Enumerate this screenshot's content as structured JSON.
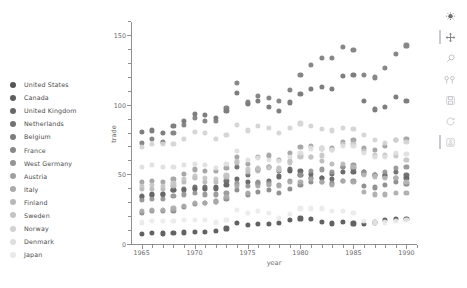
{
  "chart_data": {
    "type": "scatter",
    "title": "",
    "xlabel": "year",
    "ylabel": "trade",
    "xlim": [
      1964,
      1991
    ],
    "ylim": [
      0,
      160
    ],
    "x_ticks": [
      1965,
      1970,
      1975,
      1980,
      1985,
      1990
    ],
    "y_ticks": [
      0,
      50,
      100,
      150
    ],
    "grid": false,
    "legend_position": "left-outside",
    "series": [
      {
        "name": "United States",
        "color": "#555555",
        "x": [
          1965,
          1966,
          1967,
          1968,
          1969,
          1970,
          1971,
          1972,
          1973,
          1974,
          1975,
          1976,
          1977,
          1978,
          1979,
          1980,
          1981,
          1982,
          1983,
          1984,
          1985,
          1986,
          1987,
          1988,
          1989,
          1990
        ],
        "values": [
          9.6,
          10.2,
          10.0,
          10.7,
          10.8,
          11.3,
          11.2,
          11.9,
          13.6,
          17.5,
          16.2,
          16.8,
          17.0,
          17.7,
          19.6,
          20.8,
          20.2,
          18.4,
          17.2,
          18.3,
          17.3,
          17.1,
          18.0,
          19.7,
          20.7,
          20.6
        ]
      },
      {
        "name": "Canada",
        "color": "#5e5e5e",
        "x": [
          1965,
          1966,
          1967,
          1968,
          1969,
          1970,
          1971,
          1972,
          1973,
          1974,
          1975,
          1976,
          1977,
          1978,
          1979,
          1980,
          1981,
          1982,
          1983,
          1984,
          1985,
          1986,
          1987,
          1988,
          1989,
          1990
        ],
        "values": [
          36.0,
          38.0,
          38.5,
          41.0,
          41.5,
          42.0,
          42.0,
          43.0,
          45.0,
          49.0,
          47.0,
          46.0,
          48.0,
          51.0,
          55.0,
          55.0,
          53.0,
          50.0,
          49.0,
          54.0,
          54.0,
          54.0,
          52.0,
          52.0,
          50.0,
          50.0
        ]
      },
      {
        "name": "United Kingdom",
        "color": "#686868",
        "x": [
          1965,
          1966,
          1967,
          1968,
          1969,
          1970,
          1971,
          1972,
          1973,
          1974,
          1975,
          1976,
          1977,
          1978,
          1979,
          1980,
          1981,
          1982,
          1983,
          1984,
          1985,
          1986,
          1987,
          1988,
          1989,
          1990
        ],
        "values": [
          37.0,
          37.5,
          38.0,
          41.0,
          42.0,
          43.0,
          43.0,
          42.0,
          48.0,
          58.0,
          52.0,
          56.0,
          58.0,
          55.0,
          56.0,
          52.0,
          50.0,
          50.0,
          53.0,
          58.0,
          57.0,
          53.0,
          52.0,
          51.0,
          54.0,
          52.0
        ]
      },
      {
        "name": "Netherlands",
        "color": "#737373",
        "x": [
          1965,
          1966,
          1967,
          1968,
          1969,
          1970,
          1971,
          1972,
          1973,
          1974,
          1975,
          1976,
          1977,
          1978,
          1979,
          1980,
          1981,
          1982,
          1983,
          1984,
          1985,
          1986,
          1987,
          1988,
          1989,
          1990
        ],
        "values": [
          83.0,
          84.0,
          82.0,
          87.0,
          91.0,
          96.0,
          95.0,
          93.0,
          98.0,
          111.0,
          103.0,
          105.0,
          101.0,
          98.0,
          104.0,
          110.0,
          114.0,
          115.0,
          114.0,
          123.0,
          124.0,
          105.0,
          99.0,
          101.0,
          108.0,
          105.0
        ]
      },
      {
        "name": "Belgium",
        "color": "#7d7d7d",
        "x": [
          1965,
          1966,
          1967,
          1968,
          1969,
          1970,
          1971,
          1972,
          1973,
          1974,
          1975,
          1976,
          1977,
          1978,
          1979,
          1980,
          1981,
          1982,
          1983,
          1984,
          1985,
          1986,
          1987,
          1988,
          1989,
          1990
        ],
        "values": [
          75.0,
          78.0,
          76.0,
          82.0,
          88.0,
          93.0,
          91.0,
          91.0,
          100.0,
          118.0,
          104.0,
          109.0,
          107.0,
          105.0,
          113.0,
          124.0,
          131.0,
          136.0,
          136.0,
          144.0,
          142.0,
          124.0,
          122.0,
          129.0,
          139.0,
          145.0
        ]
      },
      {
        "name": "France",
        "color": "#888888",
        "x": [
          1965,
          1966,
          1967,
          1968,
          1969,
          1970,
          1971,
          1972,
          1973,
          1974,
          1975,
          1976,
          1977,
          1978,
          1979,
          1980,
          1981,
          1982,
          1983,
          1984,
          1985,
          1986,
          1987,
          1988,
          1989,
          1990
        ],
        "values": [
          25.0,
          26.0,
          26.0,
          26.0,
          29.0,
          31.0,
          32.0,
          33.0,
          35.0,
          41.0,
          38.0,
          40.0,
          41.0,
          39.0,
          42.0,
          45.0,
          47.0,
          47.0,
          46.0,
          48.0,
          48.0,
          44.0,
          43.0,
          45.0,
          47.0,
          46.0
        ]
      },
      {
        "name": "West Germany",
        "color": "#949494",
        "x": [
          1965,
          1966,
          1967,
          1968,
          1969,
          1970,
          1971,
          1972,
          1973,
          1974,
          1975,
          1976,
          1977,
          1978,
          1979,
          1980,
          1981,
          1982,
          1983,
          1984,
          1985,
          1986,
          1987,
          1988,
          1989,
          1990
        ],
        "values": [
          34.0,
          35.0,
          35.0,
          37.0,
          38.0,
          39.0,
          38.0,
          38.0,
          39.0,
          46.0,
          44.0,
          47.0,
          46.0,
          45.0,
          48.0,
          52.0,
          55.0,
          56.0,
          54.0,
          58.0,
          59.0,
          54.0,
          52.0,
          54.0,
          57.0,
          58.0
        ]
      },
      {
        "name": "Austria",
        "color": "#9f9f9f",
        "x": [
          1965,
          1966,
          1967,
          1968,
          1969,
          1970,
          1971,
          1972,
          1973,
          1974,
          1975,
          1976,
          1977,
          1978,
          1979,
          1980,
          1981,
          1982,
          1983,
          1984,
          1985,
          1986,
          1987,
          1988,
          1989,
          1990
        ],
        "values": [
          47.0,
          48.0,
          47.0,
          49.0,
          53.0,
          56.0,
          55.0,
          55.0,
          57.0,
          65.0,
          60.0,
          65.0,
          66.0,
          63.0,
          68.0,
          72.0,
          73.0,
          71.0,
          71.0,
          76.0,
          77.0,
          71.0,
          70.0,
          73.0,
          77.0,
          78.0
        ]
      },
      {
        "name": "Italy",
        "color": "#aaaaaa",
        "x": [
          1965,
          1966,
          1967,
          1968,
          1969,
          1970,
          1971,
          1972,
          1973,
          1974,
          1975,
          1976,
          1977,
          1978,
          1979,
          1980,
          1981,
          1982,
          1983,
          1984,
          1985,
          1986,
          1987,
          1988,
          1989,
          1990
        ],
        "values": [
          26.0,
          27.0,
          27.0,
          28.0,
          30.0,
          32.0,
          32.0,
          33.0,
          36.0,
          44.0,
          39.0,
          44.0,
          45.0,
          44.0,
          47.0,
          47.0,
          49.0,
          47.0,
          45.0,
          48.0,
          47.0,
          40.0,
          38.0,
          38.0,
          39.0,
          39.0
        ]
      },
      {
        "name": "Finland",
        "color": "#b8b8b8",
        "x": [
          1965,
          1966,
          1967,
          1968,
          1969,
          1970,
          1971,
          1972,
          1973,
          1974,
          1975,
          1976,
          1977,
          1978,
          1979,
          1980,
          1981,
          1982,
          1983,
          1984,
          1985,
          1986,
          1987,
          1988,
          1989,
          1990
        ],
        "values": [
          42.0,
          42.0,
          42.0,
          44.0,
          47.0,
          50.0,
          47.0,
          47.0,
          51.0,
          61.0,
          54.0,
          55.0,
          58.0,
          57.0,
          62.0,
          66.0,
          65.0,
          62.0,
          60.0,
          60.0,
          58.0,
          52.0,
          51.0,
          50.0,
          50.0,
          47.0
        ]
      },
      {
        "name": "Sweden",
        "color": "#c4c4c4",
        "x": [
          1965,
          1966,
          1967,
          1968,
          1969,
          1970,
          1971,
          1972,
          1973,
          1974,
          1975,
          1976,
          1977,
          1978,
          1979,
          1980,
          1981,
          1982,
          1983,
          1984,
          1985,
          1986,
          1987,
          1988,
          1989,
          1990
        ],
        "values": [
          44.0,
          45.0,
          44.0,
          46.0,
          49.0,
          51.0,
          50.0,
          49.0,
          52.0,
          62.0,
          56.0,
          57.0,
          57.0,
          56.0,
          61.0,
          65.0,
          65.0,
          66.0,
          70.0,
          74.0,
          74.0,
          69.0,
          66.0,
          66.0,
          66.0,
          63.0
        ]
      },
      {
        "name": "Norway",
        "color": "#d2d2d2",
        "x": [
          1965,
          1966,
          1967,
          1968,
          1969,
          1970,
          1971,
          1972,
          1973,
          1974,
          1975,
          1976,
          1977,
          1978,
          1979,
          1980,
          1981,
          1982,
          1983,
          1984,
          1985,
          1986,
          1987,
          1988,
          1989,
          1990
        ],
        "values": [
          72.0,
          74.0,
          74.0,
          74.0,
          78.0,
          83.0,
          82.0,
          78.0,
          81.0,
          88.0,
          84.0,
          87.0,
          86.0,
          82.0,
          86.0,
          89.0,
          87.0,
          85.0,
          84.0,
          86.0,
          85.0,
          81.0,
          77.0,
          75.0,
          77.0,
          76.0
        ]
      },
      {
        "name": "Denmark",
        "color": "#dedede",
        "x": [
          1965,
          1966,
          1967,
          1968,
          1969,
          1970,
          1971,
          1972,
          1973,
          1974,
          1975,
          1976,
          1977,
          1978,
          1979,
          1980,
          1981,
          1982,
          1983,
          1984,
          1985,
          1986,
          1987,
          1988,
          1989,
          1990
        ],
        "values": [
          58.0,
          59.0,
          58.0,
          58.0,
          59.0,
          60.0,
          59.0,
          57.0,
          60.0,
          69.0,
          63.0,
          64.0,
          63.0,
          62.0,
          65.0,
          68.0,
          71.0,
          71.0,
          70.0,
          73.0,
          73.0,
          68.0,
          65.0,
          65.0,
          68.0,
          67.0
        ]
      },
      {
        "name": "Japan",
        "color": "#eaeaea",
        "x": [
          1965,
          1966,
          1967,
          1968,
          1969,
          1970,
          1971,
          1972,
          1973,
          1974,
          1975,
          1976,
          1977,
          1978,
          1979,
          1980,
          1981,
          1982,
          1983,
          1984,
          1985,
          1986,
          1987,
          1988,
          1989,
          1990
        ],
        "values": [
          18.0,
          19.0,
          19.0,
          19.0,
          20.0,
          20.0,
          20.0,
          18.0,
          20.0,
          27.0,
          25.0,
          26.0,
          25.0,
          21.0,
          24.0,
          28.0,
          28.0,
          28.0,
          26.0,
          26.0,
          25.0,
          19.0,
          18.0,
          18.0,
          19.0,
          20.0
        ]
      }
    ]
  },
  "legend": {
    "items": [
      {
        "label": "United States",
        "color": "#555555"
      },
      {
        "label": "Canada",
        "color": "#5e5e5e"
      },
      {
        "label": "United Kingdom",
        "color": "#686868"
      },
      {
        "label": "Netherlands",
        "color": "#737373"
      },
      {
        "label": "Belgium",
        "color": "#7d7d7d"
      },
      {
        "label": "France",
        "color": "#888888"
      },
      {
        "label": "West Germany",
        "color": "#949494"
      },
      {
        "label": "Austria",
        "color": "#9f9f9f"
      },
      {
        "label": "Italy",
        "color": "#aaaaaa"
      },
      {
        "label": "Finland",
        "color": "#b8b8b8"
      },
      {
        "label": "Sweden",
        "color": "#c4c4c4"
      },
      {
        "label": "Norway",
        "color": "#d2d2d2"
      },
      {
        "label": "Denmark",
        "color": "#dedede"
      },
      {
        "label": "Japan",
        "color": "#eaeaea"
      }
    ]
  },
  "toolbar": {
    "buttons": [
      {
        "name": "home-icon",
        "title": "Home"
      },
      {
        "name": "move-icon",
        "title": "Pan"
      },
      {
        "name": "zoom-icon",
        "title": "Zoom"
      },
      {
        "name": "subplots-icon",
        "title": "Configure subplots"
      },
      {
        "name": "save-icon",
        "title": "Save"
      },
      {
        "name": "refresh-icon",
        "title": "Refresh"
      },
      {
        "name": "screenshot-icon",
        "title": "Capture"
      }
    ]
  }
}
